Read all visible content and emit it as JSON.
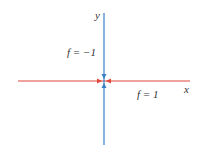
{
  "diagram": {
    "axis_labels": {
      "x": "x",
      "y": "y"
    },
    "annotations": {
      "upper_left": "f = −1",
      "lower_right": "f = 1"
    },
    "colors": {
      "horizontal_axis": "#e0473a",
      "vertical_axis": "#3b7fc4",
      "text": "#333333"
    }
  }
}
